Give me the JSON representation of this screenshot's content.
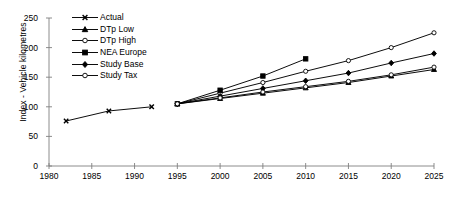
{
  "chart_data": {
    "type": "line",
    "title": "",
    "xlabel": "",
    "ylabel": "Index - Vehicle kilometres",
    "xlim": [
      1980,
      2025
    ],
    "ylim": [
      0,
      250
    ],
    "xticks": [
      1980,
      1985,
      1990,
      1995,
      2000,
      2005,
      2010,
      2015,
      2020,
      2025
    ],
    "yticks": [
      0,
      50,
      100,
      150,
      200,
      250
    ],
    "grid": false,
    "legend_position": "upper-left-inside",
    "series": [
      {
        "name": "Actual",
        "marker": "x-cross",
        "fill": "none",
        "x": [
          1982,
          1987,
          1992
        ],
        "values": [
          76,
          93,
          100
        ]
      },
      {
        "name": "DTp Low",
        "marker": "triangle",
        "fill": "solid",
        "x": [
          1995,
          2000,
          2005,
          2010,
          2015,
          2020,
          2025
        ],
        "values": [
          105,
          114,
          123,
          132,
          141,
          152,
          163
        ]
      },
      {
        "name": "DTp High",
        "marker": "circle",
        "fill": "open",
        "x": [
          1995,
          2000,
          2005,
          2010,
          2015,
          2020,
          2025
        ],
        "values": [
          105,
          123,
          141,
          160,
          178,
          200,
          225
        ]
      },
      {
        "name": "NEA Europe",
        "marker": "square",
        "fill": "solid",
        "x": [
          1995,
          2000,
          2005,
          2010
        ],
        "values": [
          105,
          128,
          152,
          181
        ]
      },
      {
        "name": "Study Base",
        "marker": "diamond",
        "fill": "solid",
        "x": [
          1995,
          2000,
          2005,
          2010,
          2015,
          2020,
          2025
        ],
        "values": [
          105,
          118,
          131,
          144,
          157,
          174,
          190
        ]
      },
      {
        "name": "Study Tax",
        "marker": "circle",
        "fill": "open",
        "x": [
          1995,
          2000,
          2005,
          2010,
          2015,
          2020,
          2025
        ],
        "values": [
          105,
          115,
          125,
          134,
          143,
          154,
          167
        ]
      }
    ]
  },
  "legend": {
    "items": [
      {
        "label": "Actual"
      },
      {
        "label": "DTp Low"
      },
      {
        "label": "DTp High"
      },
      {
        "label": "NEA Europe"
      },
      {
        "label": "Study Base"
      },
      {
        "label": "Study Tax"
      }
    ]
  },
  "colors": {
    "line": "#000000",
    "axis": "#808080",
    "text": "#000000",
    "background": "#ffffff"
  }
}
